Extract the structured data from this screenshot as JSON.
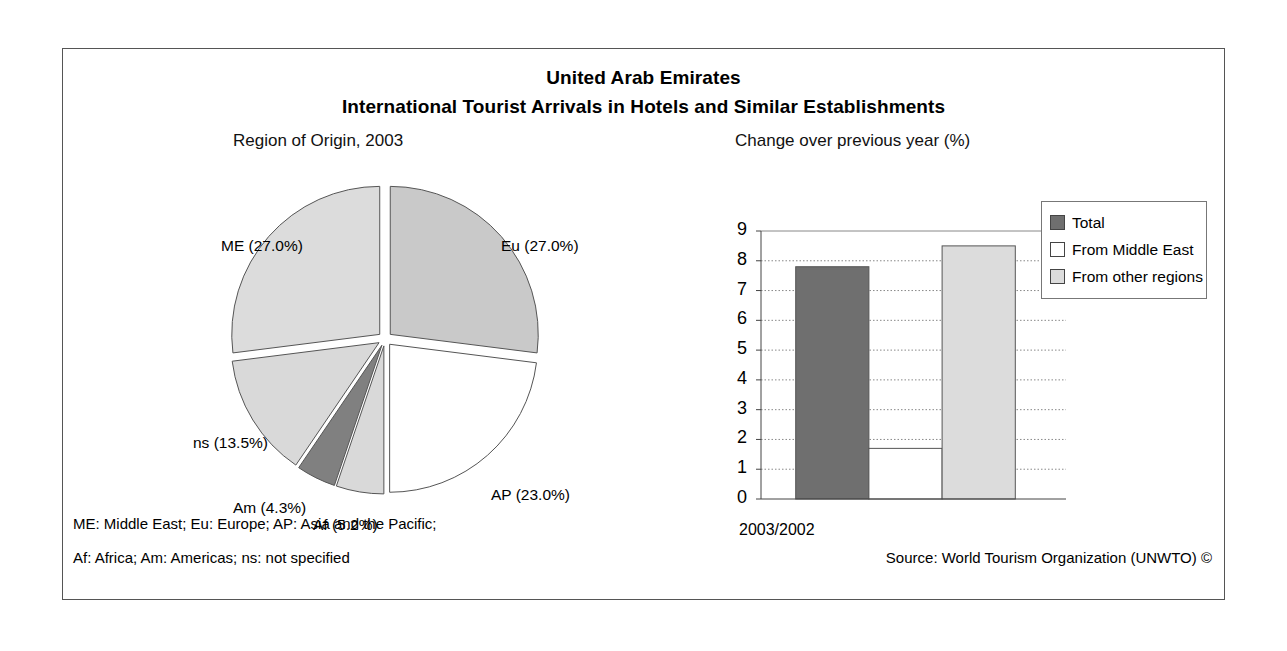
{
  "titles": {
    "line1": "United Arab Emirates",
    "line2": "International Tourist Arrivals in Hotels and Similar Establishments",
    "sub_left": "Region of Origin, 2003",
    "sub_right": "Change over previous year (%)"
  },
  "footer": {
    "note1": "ME: Middle East; Eu: Europe; AP: Asia and the Pacific;",
    "note2": "Af: Africa; Am: Americas; ns: not specified",
    "source": "Source: World Tourism Organization (UNWTO) ©"
  },
  "legend": {
    "items": [
      {
        "label": "Total",
        "color": "#6f6f6f"
      },
      {
        "label": "From Middle East",
        "color": "#ffffff"
      },
      {
        "label": "From other regions",
        "color": "#dcdcdc"
      }
    ]
  },
  "chart_data": [
    {
      "type": "pie",
      "title": "Region of Origin, 2003",
      "exploded": true,
      "start_angle_deg": 0,
      "direction": "clockwise",
      "labels": [
        "Eu (27.0%)",
        "AP (23.0%)",
        "Af (5.2%)",
        "Am (4.3%)",
        "ns (13.5%)",
        "ME (27.0%)"
      ],
      "categories": [
        "Eu",
        "AP",
        "Af",
        "Am",
        "ns",
        "ME"
      ],
      "values": [
        27.0,
        23.0,
        5.2,
        4.3,
        13.5,
        27.0
      ],
      "colors": [
        "#c9c9c9",
        "#ffffff",
        "#d9d9d9",
        "#808080",
        "#d9d9d9",
        "#dcdcdc"
      ],
      "legend": "labels on slices"
    },
    {
      "type": "bar",
      "title": "Change over previous year (%)",
      "categories": [
        "2003/2002"
      ],
      "xlabel": "2003/2002",
      "ylabel": "",
      "ylim": [
        0,
        9
      ],
      "yticks": [
        "0",
        "1",
        "2",
        "3",
        "4",
        "5",
        "6",
        "7",
        "8",
        "9"
      ],
      "grid": true,
      "legend_position": "right",
      "series": [
        {
          "name": "Total",
          "values": [
            7.8
          ],
          "color": "#6f6f6f"
        },
        {
          "name": "From Middle East",
          "values": [
            1.7
          ],
          "color": "#ffffff"
        },
        {
          "name": "From other regions",
          "values": [
            8.5
          ],
          "color": "#dcdcdc"
        }
      ]
    }
  ]
}
